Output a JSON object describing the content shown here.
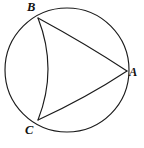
{
  "figure": {
    "type": "geometry-diagram",
    "background_color": "#ffffff",
    "stroke_color": "#1b1b1b",
    "labels": {
      "A": "A",
      "B": "B",
      "C": "C"
    },
    "circle": {
      "name": "outer-circle",
      "center_x": 67,
      "center_y": 70,
      "radius": 62
    },
    "vertices": [
      {
        "id": "A",
        "x": 127,
        "y": 71
      },
      {
        "id": "B",
        "x": 38,
        "y": 18
      },
      {
        "id": "C",
        "x": 38,
        "y": 120
      }
    ],
    "arcs": [
      {
        "id": "arc-BA",
        "from": "B",
        "to": "A",
        "bulge": "concave-toward-upper-right"
      },
      {
        "id": "arc-CA",
        "from": "C",
        "to": "A",
        "bulge": "concave-toward-lower-right"
      },
      {
        "id": "arc-BC",
        "from": "B",
        "to": "C",
        "bulge": "concave-toward-left"
      }
    ],
    "paths": {
      "arc_BA": "M 38 18 Q 86 44 127 71",
      "arc_CA": "M 38 120 Q 86 98 127 71",
      "arc_BC": "M 38 18 Q 58 69 38 120"
    }
  }
}
